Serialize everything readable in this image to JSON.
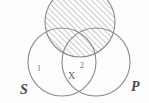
{
  "diagram": {
    "type": "venn-diagram",
    "background_color": "#fdfdfd",
    "stroke_color": "#8a8a8d",
    "hatch_color": "#9a9a9d",
    "label_color": "#6f6f70",
    "set_label_color": "#4a4a4c",
    "circles": [
      {
        "name": "top-circle",
        "label": "",
        "cx": 80,
        "cy": 22,
        "r": 35,
        "shaded": true,
        "shading": "diagonal-hatch"
      },
      {
        "name": "left-circle",
        "label": "S",
        "cx": 62,
        "cy": 62,
        "r": 34,
        "shaded": false,
        "shading": "none"
      },
      {
        "name": "right-circle",
        "label": "P",
        "cx": 96,
        "cy": 62,
        "r": 34,
        "shaded": false,
        "shading": "none"
      }
    ],
    "region_labels": [
      {
        "name": "region-1",
        "text": "1",
        "x": 37,
        "y": 65
      },
      {
        "name": "region-2",
        "text": "2",
        "x": 80,
        "y": 62
      }
    ],
    "markers": [
      {
        "name": "x-marker",
        "text": "X",
        "x": 68,
        "y": 71
      }
    ],
    "set_labels": [
      {
        "name": "set-label-s",
        "text": "S",
        "x": 20,
        "y": 83
      },
      {
        "name": "set-label-p",
        "text": "P",
        "x": 131,
        "y": 80
      }
    ]
  }
}
